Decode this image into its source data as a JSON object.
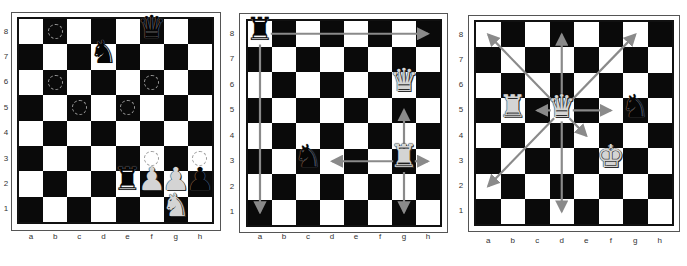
{
  "colors": {
    "light_square": "#ffffff",
    "dark_square": "#0a0a0a",
    "arrow": "#8a8a8a",
    "marker": "#9a9a9a"
  },
  "files": [
    "a",
    "b",
    "c",
    "d",
    "e",
    "f",
    "g",
    "h"
  ],
  "ranks": [
    "8",
    "7",
    "6",
    "5",
    "4",
    "3",
    "2",
    "1"
  ],
  "boards": [
    {
      "id": "board-1",
      "frame": {
        "x": 11,
        "y": 12,
        "w": 210,
        "h": 219
      },
      "inner": {
        "x": 17,
        "y": 17,
        "w": 197,
        "h": 207
      },
      "rank_label_x": 0,
      "file_label_y": 232,
      "pieces": [
        {
          "square": "f8",
          "type": "queen",
          "color": "black",
          "glyph": "♛"
        },
        {
          "square": "d7",
          "type": "knight",
          "color": "black",
          "glyph": "♞"
        },
        {
          "square": "e2",
          "type": "rook",
          "color": "black",
          "glyph": "♜"
        },
        {
          "square": "f2",
          "type": "pawn",
          "color": "white",
          "glyph": "♟"
        },
        {
          "square": "g2",
          "type": "pawn",
          "color": "white",
          "glyph": "♟"
        },
        {
          "square": "g1",
          "type": "knight",
          "color": "white",
          "glyph": "♞"
        },
        {
          "square": "h2",
          "type": "pawn",
          "color": "black",
          "glyph": "♟"
        }
      ],
      "markers": [
        "b8",
        "b6",
        "f6",
        "c5",
        "e5",
        "f3",
        "h3"
      ],
      "arrows": []
    },
    {
      "id": "board-2",
      "frame": {
        "x": 239,
        "y": 13,
        "w": 209,
        "h": 220
      },
      "inner": {
        "x": 246,
        "y": 19,
        "w": 196,
        "h": 208
      },
      "rank_label_x": 226,
      "file_label_y": 232,
      "pieces": [
        {
          "square": "a8",
          "type": "rook",
          "color": "black",
          "glyph": "♜"
        },
        {
          "square": "g6",
          "type": "queen",
          "color": "white",
          "glyph": "♛"
        },
        {
          "square": "g3",
          "type": "rook",
          "color": "white",
          "glyph": "♜"
        },
        {
          "square": "c3",
          "type": "knight",
          "color": "black",
          "glyph": "♞"
        }
      ],
      "markers": [],
      "arrows": [
        {
          "from": "a8",
          "to": "h8"
        },
        {
          "from": "a8",
          "to": "a1"
        },
        {
          "from": "g3",
          "to": "g5"
        },
        {
          "from": "g3",
          "to": "d3"
        },
        {
          "from": "g3",
          "to": "h3"
        },
        {
          "from": "g3",
          "to": "g1"
        }
      ]
    },
    {
      "id": "board-3",
      "frame": {
        "x": 468,
        "y": 15,
        "w": 212,
        "h": 217
      },
      "inner": {
        "x": 474,
        "y": 20,
        "w": 200,
        "h": 206
      },
      "rank_label_x": 455,
      "file_label_y": 236,
      "pieces": [
        {
          "square": "d5",
          "type": "queen",
          "color": "white",
          "glyph": "♛"
        },
        {
          "square": "b5",
          "type": "rook",
          "color": "white",
          "glyph": "♜"
        },
        {
          "square": "f3",
          "type": "king",
          "color": "white",
          "glyph": "♚"
        },
        {
          "square": "g5",
          "type": "knight",
          "color": "black",
          "glyph": "♞"
        }
      ],
      "markers": [],
      "arrows": [
        {
          "from": "d5",
          "to": "a8"
        },
        {
          "from": "d5",
          "to": "d8"
        },
        {
          "from": "d5",
          "to": "g8"
        },
        {
          "from": "d5",
          "to": "c5"
        },
        {
          "from": "d5",
          "to": "f5"
        },
        {
          "from": "d5",
          "to": "e4"
        },
        {
          "from": "d5",
          "to": "d1"
        },
        {
          "from": "d5",
          "to": "a2"
        }
      ]
    }
  ]
}
